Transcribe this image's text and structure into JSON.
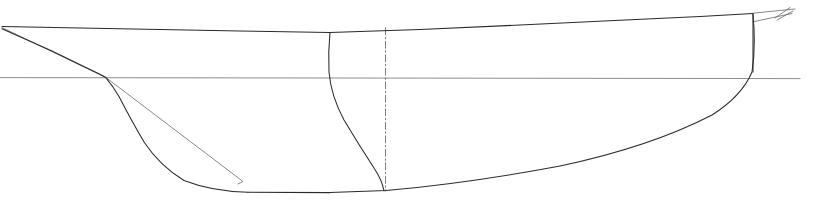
{
  "document": {
    "title": "Ship Hull Lines Plan — Profile (Sheer) View",
    "view": "profile",
    "background_color": "#ffffff",
    "canvas": {
      "width": 835,
      "height": 203
    }
  },
  "style": {
    "hull_line_color": "#2b2b2b",
    "hull_line_width": 1.05,
    "reference_line_color": "#808080",
    "reference_line_width": 0.9,
    "construction_line_color": "#6a6a6a",
    "construction_line_width": 0.8,
    "centerline_color": "#6f6f6f",
    "centerline_width": 0.9,
    "centerline_dash": "7 2.5 1.5 2.5"
  },
  "geometry": {
    "sheer_deck_line": {
      "label": "sheer / deck line",
      "kind": "polyline",
      "color_role": "hull_line_color",
      "points": "2,26.5 120,28.7 240,31.0 330,32.6 420,29.5 520,25.0 620,20.2 700,16.4 753,13.6"
    },
    "stem_profile": {
      "label": "stem / bow profile",
      "kind": "path",
      "color_role": "hull_line_color",
      "d": "M 2,28.8 L 52,51.0 L 90,69.5 Q 101,74.5 106,77.8 Q 113,86.0 119,96.5 Q 130,118.0 144,142.0 Q 160,166.0 184,180.5 Q 212,191.5 248,192.2"
    },
    "keel_line": {
      "label": "keel / bottom line",
      "kind": "path",
      "color_role": "hull_line_color",
      "d": "M 248,192.2 L 330,192.6 L 386,190.6 Q 470,183.0 560,166.0 Q 650,147.0 712,115.0 Q 742,96.0 752,72.0 Q 756,46.0 753,14.6"
    },
    "transom_line": {
      "label": "transom / stern post",
      "kind": "line",
      "color_role": "hull_line_color",
      "points": "753,13.6 753,72.0"
    },
    "designed_waterline": {
      "label": "designed waterline (DWL)",
      "kind": "line",
      "color_role": "reference_line_color",
      "points": "0,77.6 800,78.6"
    },
    "bow_construction_line": {
      "label": "bow diagonal construction line",
      "kind": "polyline",
      "color_role": "construction_line_color",
      "points": "2,27.6 106,77.6 243,181.5 238,184.0"
    },
    "midship_section_curve": {
      "label": "midship body section curve",
      "kind": "path",
      "color_role": "hull_line_color",
      "d": "M 330,32.6 Q 328,52.0 329,72.0 Q 331,96.0 344,120.0 Q 359,145.0 374,168.0 Q 382,180.0 384,190.8"
    },
    "centerline": {
      "label": "vertical centerline (dash-dot)",
      "kind": "line",
      "color_role": "centerline_color",
      "points": "385.5,27.8 385.5,191.0"
    },
    "counter_stern_upper": {
      "label": "counter stern upper edge",
      "kind": "line",
      "color_role": "construction_line_color",
      "points": "753,13.2 795,9.0"
    },
    "counter_stern_lower": {
      "label": "counter stern lower edge",
      "kind": "line",
      "color_role": "construction_line_color",
      "points": "753,21.8 792,13.5"
    },
    "stern_tick_upper": {
      "label": "stern overhang tick mark upper",
      "kind": "line",
      "color_role": "construction_line_color",
      "points": "775,18.0 790,7.5"
    },
    "stern_tick_lower": {
      "label": "stern overhang tick mark lower",
      "kind": "line",
      "color_role": "construction_line_color",
      "points": "777,20.0 793,11.0"
    }
  },
  "labels": {
    "none_visible": ""
  }
}
